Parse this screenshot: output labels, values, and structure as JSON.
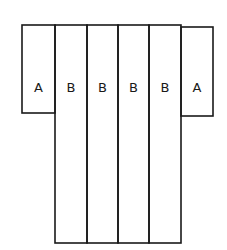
{
  "diagram": {
    "stroke_color": "#1a1a1a",
    "background": "#ffffff",
    "panels": [
      {
        "id": "left-sleeve",
        "label": "A",
        "x": 22,
        "y": 25,
        "w": 33,
        "h": 88
      },
      {
        "id": "body-1",
        "label": "B",
        "x": 55,
        "y": 25,
        "w": 32,
        "h": 218
      },
      {
        "id": "body-2",
        "label": "B",
        "x": 87,
        "y": 25,
        "w": 31,
        "h": 218
      },
      {
        "id": "body-3",
        "label": "B",
        "x": 118,
        "y": 25,
        "w": 31,
        "h": 218
      },
      {
        "id": "body-4",
        "label": "B",
        "x": 149,
        "y": 25,
        "w": 32,
        "h": 218
      },
      {
        "id": "right-sleeve",
        "label": "A",
        "x": 181,
        "y": 27,
        "w": 32,
        "h": 89
      }
    ]
  }
}
